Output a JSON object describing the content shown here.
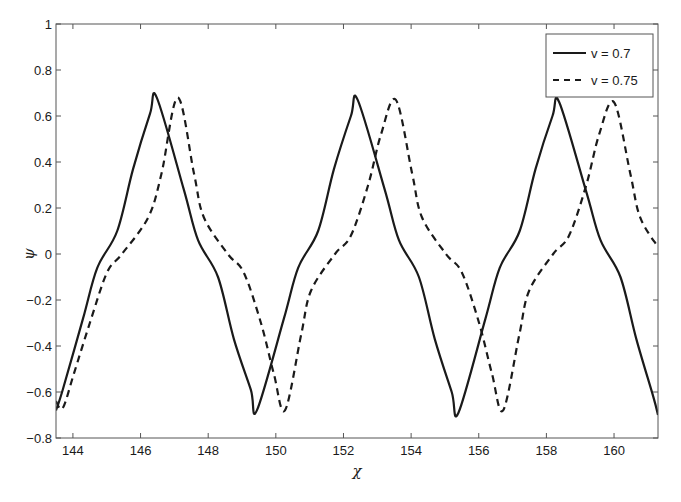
{
  "chart_data": {
    "type": "line",
    "title": "",
    "xlabel": "χ",
    "ylabel": "ψ",
    "xlim": [
      143.5,
      161.3
    ],
    "ylim": [
      -0.8,
      1.0
    ],
    "xticks": [
      144,
      146,
      148,
      150,
      152,
      154,
      156,
      158,
      160
    ],
    "yticks": [
      -0.8,
      -0.6,
      -0.4,
      -0.2,
      0,
      0.2,
      0.4,
      0.6,
      0.8,
      1
    ],
    "ytick_labels": [
      "-0.8",
      "-0.6",
      "-0.4",
      "-0.2",
      "0",
      "0.2",
      "0.4",
      "0.6",
      "0.8",
      "1"
    ],
    "grid": false,
    "legend_position": "upper right",
    "series": [
      {
        "name": "v = 0.7",
        "style": "solid",
        "color": "#1a1a1a",
        "x": [
          143.5,
          143.7,
          144.3,
          144.72,
          145.31,
          145.78,
          146.28,
          146.48,
          147.28,
          147.7,
          148.29,
          148.76,
          149.26,
          149.44,
          150.24,
          150.66,
          151.25,
          151.72,
          152.22,
          152.42,
          153.22,
          153.64,
          154.23,
          154.7,
          155.2,
          155.4,
          156.2,
          156.62,
          157.21,
          157.68,
          158.18,
          158.38,
          159.18,
          159.6,
          160.19,
          160.66,
          161.16,
          161.3
        ],
        "y": [
          -0.68,
          -0.59,
          -0.28,
          -0.06,
          0.1,
          0.37,
          0.61,
          0.68,
          0.28,
          0.06,
          -0.1,
          -0.37,
          -0.59,
          -0.68,
          -0.28,
          -0.06,
          0.1,
          0.37,
          0.6,
          0.67,
          0.28,
          0.06,
          -0.1,
          -0.37,
          -0.6,
          -0.69,
          -0.28,
          -0.06,
          0.1,
          0.37,
          0.6,
          0.66,
          0.27,
          0.06,
          -0.1,
          -0.37,
          -0.62,
          -0.7
        ]
      },
      {
        "name": "v = 0.75",
        "style": "dashed",
        "color": "#1a1a1a",
        "x": [
          143.5,
          143.7,
          144.03,
          144.5,
          145.01,
          145.45,
          146.23,
          146.62,
          147.1,
          147.58,
          147.87,
          148.58,
          149.05,
          149.56,
          149.94,
          150.27,
          150.75,
          151.04,
          151.75,
          152.22,
          152.73,
          153.11,
          153.55,
          154.03,
          154.32,
          155.03,
          155.5,
          156.01,
          156.39,
          156.72,
          157.2,
          157.49,
          158.2,
          158.67,
          159.18,
          159.56,
          160.0,
          160.48,
          160.77,
          161.3
        ],
        "y": [
          -0.64,
          -0.67,
          -0.52,
          -0.3,
          -0.08,
          0.0,
          0.16,
          0.35,
          0.68,
          0.35,
          0.16,
          0.0,
          -0.08,
          -0.3,
          -0.52,
          -0.68,
          -0.35,
          -0.16,
          0.0,
          0.08,
          0.3,
          0.52,
          0.67,
          0.35,
          0.16,
          0.0,
          -0.08,
          -0.3,
          -0.52,
          -0.68,
          -0.35,
          -0.16,
          0.0,
          0.08,
          0.3,
          0.52,
          0.66,
          0.35,
          0.16,
          0.03
        ]
      }
    ]
  },
  "legend": {
    "items": [
      {
        "label": "v = 0.7",
        "style": "solid"
      },
      {
        "label": "v = 0.75",
        "style": "dashed"
      }
    ]
  },
  "axes": {
    "xlabel": "χ",
    "ylabel": "ψ"
  }
}
